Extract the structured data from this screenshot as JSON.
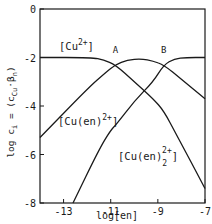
{
  "chart_data": {
    "type": "line",
    "title": "",
    "xlabel": "log[en]",
    "ylabel": "log c_i = (c_Cu · β_n)",
    "xlim": [
      -14,
      -7
    ],
    "ylim": [
      -8,
      0
    ],
    "x_ticks": [
      -13,
      -11,
      -9,
      -7
    ],
    "x_tick_labels": [
      "-13",
      "-11",
      "-9",
      "-7"
    ],
    "y_ticks": [
      0,
      -2,
      -4,
      -6,
      -8
    ],
    "y_tick_labels": [
      "0",
      "-2",
      "-4",
      "-6",
      "-8"
    ],
    "grid": false,
    "legend": "none (inline curve labels)",
    "series": [
      {
        "name": "[Cu2+]",
        "label_main": "[Cu",
        "label_sup": "2+",
        "label_close": "]",
        "x": [
          -14,
          -11.8,
          -11.3,
          -10.8,
          -10,
          -9.2,
          -8.75,
          -8.2,
          -7
        ],
        "y": [
          -2,
          -2,
          -2.1,
          -2.3,
          -3.0,
          -3.7,
          -4.2,
          -5.2,
          -7.4
        ]
      },
      {
        "name": "[Cu(en)2+]",
        "label_main": "[Cu(en)",
        "label_sup": "2+",
        "label_close": "]",
        "x": [
          -14,
          -12,
          -11.2,
          -10.8,
          -10.3,
          -9.7,
          -9.2,
          -8.75,
          -8,
          -7
        ],
        "y": [
          -5.3,
          -3.3,
          -2.6,
          -2.3,
          -2.1,
          -2.05,
          -2.15,
          -2.3,
          -2.9,
          -3.7
        ]
      },
      {
        "name": "[Cu(en)2 2+]",
        "label_main": "[Cu(en)",
        "label_sub": "2",
        "label_sup": "2+",
        "label_close": "]",
        "x": [
          -12.6,
          -11.5,
          -11,
          -10.8,
          -10,
          -9.2,
          -8.75,
          -8.3,
          -7.8,
          -7
        ],
        "y": [
          -8,
          -5.8,
          -5.0,
          -4.8,
          -3.8,
          -3.0,
          -2.3,
          -2.05,
          -2,
          -2
        ]
      }
    ],
    "annotations": [
      {
        "text": "A",
        "x": -10.8,
        "y": -1.8,
        "marks": "crossing of [Cu2+] and [Cu(en)2+]"
      },
      {
        "text": "B",
        "x": -8.75,
        "y": -1.8,
        "marks": "crossing of [Cu(en)2+] and [Cu(en)2 2+]"
      }
    ]
  }
}
